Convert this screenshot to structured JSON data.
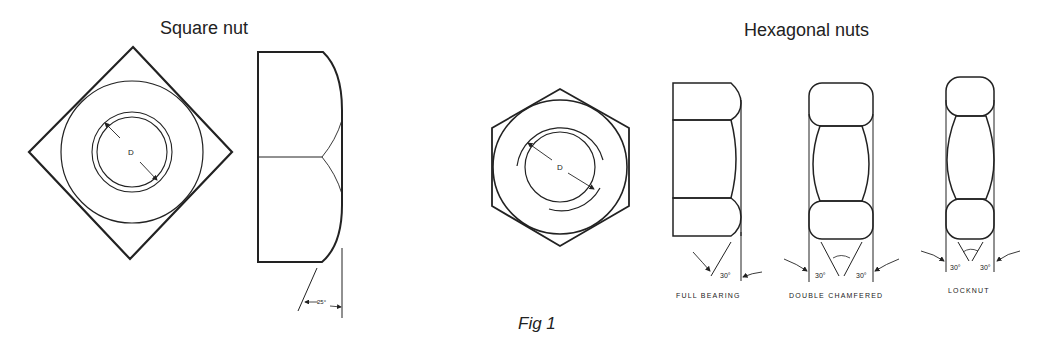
{
  "titles": {
    "square": "Square nut",
    "hexagonal": "Hexagonal nuts"
  },
  "labels": {
    "diameter_square": "D",
    "diameter_hex": "D",
    "square_chamfer_angle": "25°",
    "full_bearing_angle": "30°",
    "double_chamfered_left_angle": "30°",
    "double_chamfered_right_angle": "30°",
    "locknut_left_angle": "30°",
    "locknut_right_angle": "30°"
  },
  "captions": {
    "full_bearing": "FULL BEARING",
    "double_chamfered": "DOUBLE CHAMFERED",
    "locknut": "LOCKNUT"
  },
  "figure_caption": "Fig 1",
  "colors": {
    "ink": "#222222",
    "background": "#ffffff"
  }
}
